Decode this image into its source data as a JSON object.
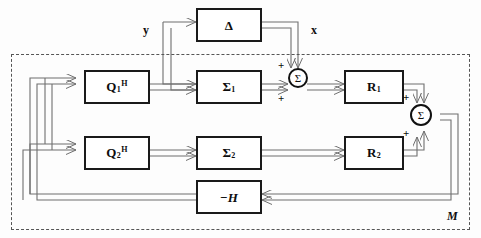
{
  "diagram": {
    "boundary_label": "M",
    "colors": {
      "line": "#6f6f6f",
      "block_border": "#1a1a1a",
      "text": "#0d0d0d",
      "dashed_border": "#555555",
      "background": "#fdfdfd"
    },
    "blocks": [
      {
        "id": "delta",
        "label": "Δ",
        "base": "Δ",
        "sub": "",
        "sup": "",
        "italic": false
      },
      {
        "id": "q1h",
        "label": "Q1H",
        "base": "Q",
        "sub": "1",
        "sup": "H",
        "italic": false
      },
      {
        "id": "q2h",
        "label": "Q2H",
        "base": "Q",
        "sub": "2",
        "sup": "H",
        "italic": false
      },
      {
        "id": "sigma1",
        "label": "Σ1",
        "base": "Σ",
        "sub": "1",
        "sup": "",
        "italic": false
      },
      {
        "id": "sigma2",
        "label": "Σ2",
        "base": "Σ",
        "sub": "2",
        "sup": "",
        "italic": false
      },
      {
        "id": "r1",
        "label": "R1",
        "base": "R",
        "sub": "1",
        "sup": "",
        "italic": false
      },
      {
        "id": "r2",
        "label": "R2",
        "base": "R",
        "sub": "2",
        "sup": "",
        "italic": false
      },
      {
        "id": "minush",
        "label": "−H",
        "base": "−H",
        "sub": "",
        "sup": "",
        "italic": true
      }
    ],
    "sum_nodes": [
      {
        "id": "sum-left",
        "glyph": "Σ",
        "signs": [
          "+",
          "+"
        ]
      },
      {
        "id": "sum-right",
        "glyph": "Σ",
        "signs": [
          "+",
          "+"
        ]
      }
    ],
    "signals": [
      {
        "id": "input-y",
        "label": "y"
      },
      {
        "id": "output-x",
        "label": "x"
      }
    ],
    "signs": {
      "sum_left_top": "+",
      "sum_left_bottom": "+",
      "sum_right_top": "+",
      "sum_right_bottom": "+"
    }
  }
}
